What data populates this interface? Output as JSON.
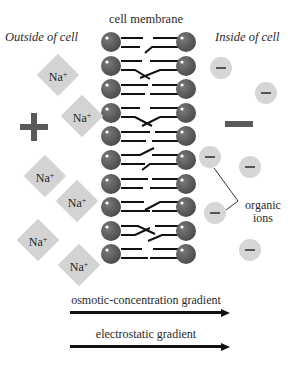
{
  "title": "cell membrane",
  "labels": {
    "outside": "Outside of cell",
    "inside": "Inside of cell",
    "organic_ions_line1": "organic",
    "organic_ions_line2": "ions"
  },
  "charges": {
    "outside_symbol": "+",
    "inside_symbol": "−"
  },
  "sodium_ions": [
    {
      "label": "Na",
      "charge": "+",
      "x": 58,
      "y": 75
    },
    {
      "label": "Na",
      "charge": "+",
      "x": 82,
      "y": 116
    },
    {
      "label": "Na",
      "charge": "+",
      "x": 45,
      "y": 176
    },
    {
      "label": "Na",
      "charge": "+",
      "x": 77,
      "y": 201
    },
    {
      "label": "Na",
      "charge": "+",
      "x": 38,
      "y": 240
    },
    {
      "label": "Na",
      "charge": "+",
      "x": 79,
      "y": 265
    }
  ],
  "organic_ions": [
    {
      "symbol": "−",
      "x": 221,
      "y": 68
    },
    {
      "symbol": "−",
      "x": 266,
      "y": 93
    },
    {
      "symbol": "−",
      "x": 210,
      "y": 157
    },
    {
      "symbol": "−",
      "x": 250,
      "y": 167
    },
    {
      "symbol": "−",
      "x": 215,
      "y": 213
    },
    {
      "symbol": "−",
      "x": 250,
      "y": 250
    }
  ],
  "membrane": {
    "lipid_count_per_leaflet": 10,
    "head_color": "#5e5e5e",
    "tail_color": "#111111"
  },
  "gradients": [
    {
      "label": "osmotic-concentration gradient",
      "direction": "right"
    },
    {
      "label": "electrostatic gradient",
      "direction": "right"
    }
  ]
}
